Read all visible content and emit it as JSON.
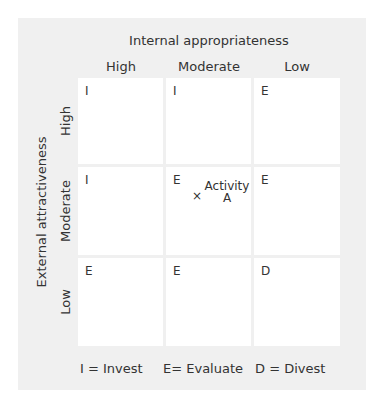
{
  "diagram": {
    "x_axis_title": "Internal appropriateness",
    "columns": [
      "High",
      "Moderate",
      "Low"
    ],
    "y_axis_title": "External attractiveness",
    "rows": [
      "High",
      "Moderate",
      "Low"
    ],
    "cells": [
      [
        "I",
        "I",
        "E"
      ],
      [
        "I",
        "E",
        "E"
      ],
      [
        "E",
        "E",
        "D"
      ]
    ],
    "marker": {
      "symbol": "×",
      "label_line1": "Activity",
      "label_line2": "A"
    },
    "legend": [
      "I = Invest",
      "E= Evaluate",
      "D = Divest"
    ]
  }
}
